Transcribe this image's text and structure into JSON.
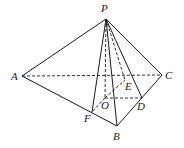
{
  "diagram": {
    "type": "pyramid P-ABC",
    "points": {
      "P": {
        "label": "P",
        "x": 106,
        "y": 19,
        "lx": 101,
        "ly": 12
      },
      "A": {
        "label": "A",
        "x": 22,
        "y": 76,
        "lx": 11,
        "ly": 80
      },
      "B": {
        "label": "B",
        "x": 117,
        "y": 126,
        "lx": 113,
        "ly": 140
      },
      "C": {
        "label": "C",
        "x": 162,
        "y": 75,
        "lx": 165,
        "ly": 79
      },
      "O": {
        "label": "O",
        "x": 105,
        "y": 98,
        "lx": 101,
        "ly": 109
      },
      "D": {
        "label": "D",
        "x": 142,
        "y": 98,
        "lx": 137,
        "ly": 110
      },
      "E": {
        "label": "E",
        "x": 125,
        "y": 80,
        "lx": 125,
        "ly": 90
      },
      "F": {
        "label": "F",
        "x": 92,
        "y": 112,
        "lx": 84,
        "ly": 122
      }
    },
    "solid_edges": [
      [
        "P",
        "A"
      ],
      [
        "P",
        "B"
      ],
      [
        "P",
        "C"
      ],
      [
        "A",
        "B"
      ],
      [
        "B",
        "C"
      ],
      [
        "P",
        "D"
      ],
      [
        "P",
        "F"
      ]
    ],
    "dashed_edges": [
      [
        "A",
        "C"
      ],
      [
        "P",
        "O"
      ],
      [
        "P",
        "E"
      ],
      [
        "O",
        "D"
      ],
      [
        "O",
        "E"
      ],
      [
        "O",
        "F"
      ]
    ]
  }
}
